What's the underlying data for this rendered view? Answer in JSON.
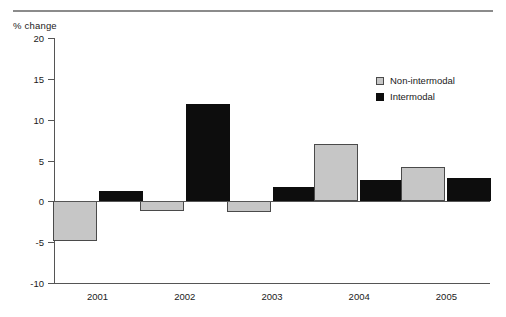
{
  "chart_data": {
    "type": "bar",
    "title": "",
    "subtitle": "",
    "xlabel": "",
    "ylabel": "% change",
    "categories": [
      "2001",
      "2002",
      "2003",
      "2004",
      "2005"
    ],
    "series": [
      {
        "name": "Non-intermodal",
        "color": "#c6c6c6",
        "values": [
          -4.9,
          -1.2,
          -1.3,
          7.0,
          4.2
        ]
      },
      {
        "name": "Intermodal",
        "color": "#0d0d0d",
        "values": [
          1.3,
          11.9,
          1.7,
          2.6,
          2.8
        ]
      }
    ],
    "ylim": [
      -10,
      20
    ],
    "ytick_values": [
      20,
      15,
      10,
      5,
      0,
      -5,
      -10
    ],
    "ytick_labels": [
      "20",
      "15",
      "10",
      "5",
      "0",
      "-5",
      "-10"
    ],
    "grid": false,
    "zero_line": true,
    "legend_position": "top-right"
  },
  "legend": {
    "items": [
      {
        "label": "Non-intermodal"
      },
      {
        "label": "Intermodal"
      }
    ]
  },
  "axis": {
    "y_title": "% change"
  }
}
